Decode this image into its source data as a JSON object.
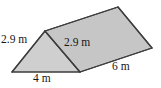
{
  "figure": {
    "kind": "triangular-prism-diagram",
    "shape_name": "triangular prism",
    "unit": "m",
    "colors": {
      "face_fill": "#c6c6c6",
      "face_fill_light": "#cfcfcf",
      "face_fill_dark": "#bdbdbd",
      "outline": "#3d3d3d",
      "background": "#ffffff",
      "label_text": "#161616"
    },
    "labels": {
      "left_slant": "2.9 m",
      "mid_slant": "2.9 m",
      "base_front": "4 m",
      "depth_right": "6 m"
    },
    "measurements": [
      {
        "name": "left-slant-edge",
        "value": 2.9,
        "unit": "m",
        "text": "2.9 m"
      },
      {
        "name": "right-slant-edge",
        "value": 2.9,
        "unit": "m",
        "text": "2.9 m"
      },
      {
        "name": "triangle-base",
        "value": 4,
        "unit": "m",
        "text": "4 m"
      },
      {
        "name": "prism-depth",
        "value": 6,
        "unit": "m",
        "text": "6 m"
      }
    ],
    "vertices": {
      "front_bottom_left": [
        12,
        72
      ],
      "front_apex": [
        45,
        31
      ],
      "front_bottom_right": [
        80,
        72
      ],
      "back_apex": [
        118,
        7
      ],
      "back_bottom_right": [
        152,
        48
      ]
    }
  }
}
